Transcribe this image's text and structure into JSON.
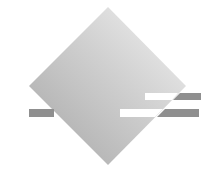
{
  "logo": {
    "shape": "diamond-with-stripes",
    "colors": {
      "background": "#ffffff",
      "diamond_light": "#e6e6e6",
      "diamond_dark": "#a8a8a8",
      "stripe": "#8c8c8c",
      "stripe_highlight": "#ffffff"
    }
  }
}
